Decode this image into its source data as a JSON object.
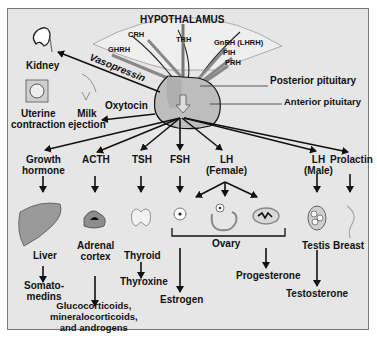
{
  "title": "HYPOTHALAMUS",
  "hypothalamic_hormones": [
    "CRH",
    "TRH",
    "GHRH",
    "GnRH (LHRH)",
    "PIH",
    "PRH"
  ],
  "pituitary": {
    "posterior": "Posterior pituitary",
    "anterior": "Anterior pituitary"
  },
  "posterior_outputs": {
    "vasopressin": "Vasopressin",
    "kidney": "Kidney",
    "oxytocin": "Oxytocin",
    "uterine": "Uterine contraction",
    "uterine_l1": "Uterine",
    "uterine_l2": "contraction",
    "milk_l1": "Milk",
    "milk_l2": "ejection"
  },
  "anterior_hormones": {
    "gh_l1": "Growth",
    "gh_l2": "hormone",
    "acth": "ACTH",
    "tsh": "TSH",
    "fsh": "FSH",
    "lhf_l1": "LH",
    "lhf_l2": "(Female)",
    "lhm_l1": "LH",
    "lhm_l2": "(Male)",
    "prolactin": "Prolactin"
  },
  "targets": {
    "liver": "Liver",
    "adrenal_l1": "Adrenal",
    "adrenal_l2": "cortex",
    "thyroid": "Thyroid",
    "ovary": "Ovary",
    "testis": "Testis",
    "breast": "Breast"
  },
  "products": {
    "somato_l1": "Somato-",
    "somato_l2": "medins",
    "gluco_l1": "Glucocorticoids,",
    "gluco_l2": "mineralocorticoids,",
    "gluco_l3": "and androgens",
    "thyroxine": "Thyroxine",
    "estrogen": "Estrogen",
    "progesterone": "Progesterone",
    "testosterone": "Testosterone"
  },
  "colors": {
    "background": "#e6e6e6",
    "border": "#7a7a7a",
    "organ_fill": "#b0b0b0",
    "text": "#111111"
  }
}
